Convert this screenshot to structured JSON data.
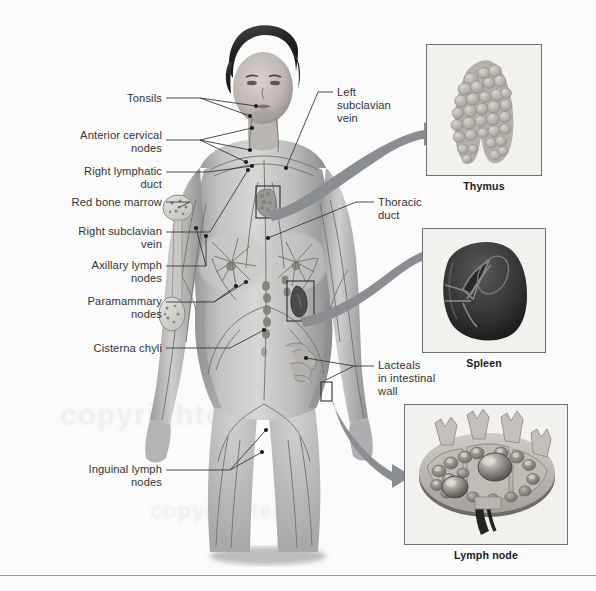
{
  "figure": {
    "title_alt": "Lymphatic system of the human body",
    "background_color": "#fbfbfb",
    "rule_color": "#9a9c9e",
    "arrow_color": "#8a8d91",
    "leader_color": "#3a3a3c",
    "label_color": "#333436",
    "watermark_text": "copyrighted"
  },
  "labels_left": [
    {
      "id": "tonsils",
      "text": "Tonsils",
      "x": 100,
      "y": 98,
      "w": 62
    },
    {
      "id": "anterior-cervical",
      "text": "Anterior cervical\nnodes",
      "x": 52,
      "y": 135,
      "w": 110
    },
    {
      "id": "right-lymphatic",
      "text": "Right lymphatic\nduct",
      "x": 50,
      "y": 168,
      "w": 112
    },
    {
      "id": "red-bone-marrow",
      "text": "Red bone marrow",
      "x": 40,
      "y": 200,
      "w": 122
    },
    {
      "id": "right-subclavian",
      "text": "Right subclavian\nvein",
      "x": 46,
      "y": 227,
      "w": 116
    },
    {
      "id": "axillary-lymph",
      "text": "Axillary lymph\nnodes",
      "x": 58,
      "y": 261,
      "w": 104
    },
    {
      "id": "paramammary",
      "text": "Paramammary\nnodes",
      "x": 62,
      "y": 297,
      "w": 100
    },
    {
      "id": "cisterna-chyli",
      "text": "Cisterna chyli",
      "x": 58,
      "y": 344,
      "w": 104
    },
    {
      "id": "inguinal-lymph",
      "text": "Inguinal lymph\nnodes",
      "x": 48,
      "y": 466,
      "w": 114
    }
  ],
  "labels_right": [
    {
      "id": "left-subclavian",
      "text": "Left\nsubclavian\nvein",
      "x": 337,
      "y": 88,
      "w": 74
    },
    {
      "id": "thoracic-duct",
      "text": "Thoracic\nduct",
      "x": 378,
      "y": 198,
      "w": 70
    },
    {
      "id": "lacteals",
      "text": "Lacteals\nin intestinal\nwall",
      "x": 378,
      "y": 361,
      "w": 82
    }
  ],
  "insets": [
    {
      "id": "thymus",
      "caption": "Thymus",
      "x": 426,
      "y": 44,
      "w": 116,
      "h": 132,
      "cap_y": 183
    },
    {
      "id": "spleen",
      "caption": "Spleen",
      "x": 422,
      "y": 228,
      "w": 124,
      "h": 125,
      "cap_y": 360
    },
    {
      "id": "node",
      "caption": "Lymph node",
      "x": 404,
      "y": 404,
      "w": 164,
      "h": 141,
      "cap_y": 552
    }
  ],
  "callout_boxes": [
    {
      "id": "thymus-site",
      "x": 256,
      "y": 186,
      "w": 24,
      "h": 32
    },
    {
      "id": "spleen-site",
      "x": 287,
      "y": 281,
      "w": 27,
      "h": 40
    },
    {
      "id": "intestine-site",
      "x": 321,
      "y": 382,
      "w": 11,
      "h": 19
    }
  ]
}
